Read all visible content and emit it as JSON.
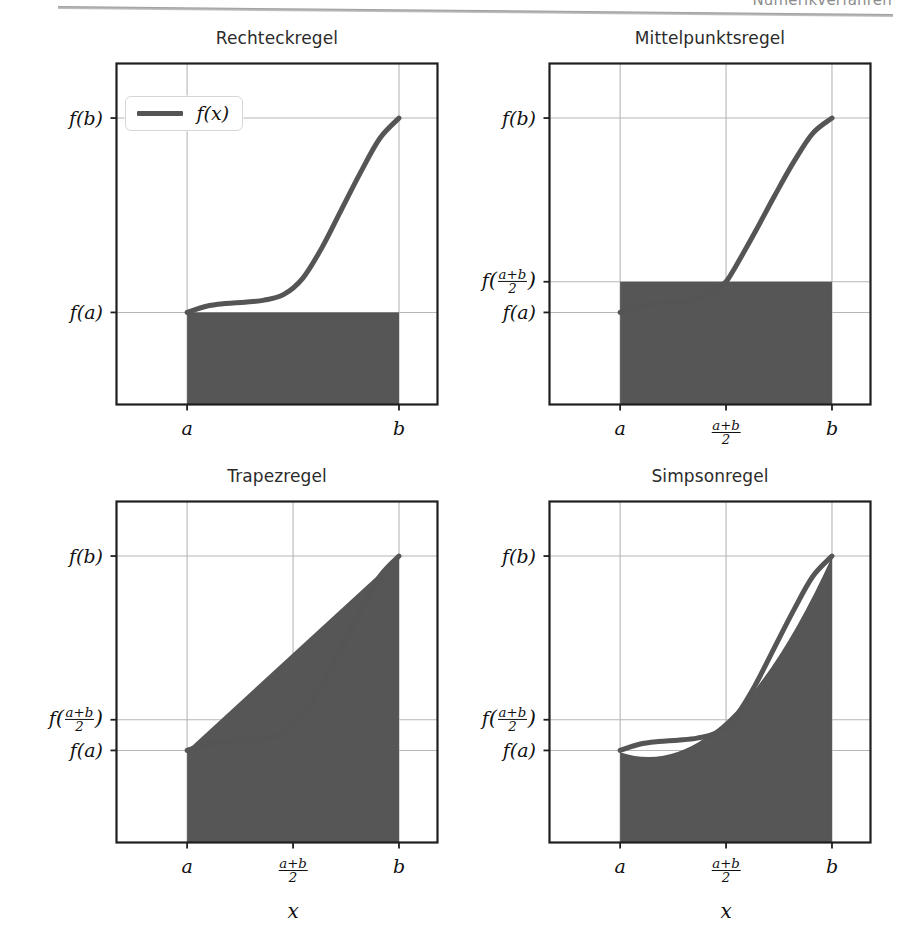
{
  "page": {
    "running_head": "Numerikverfahren",
    "bottom_caption": ""
  },
  "legend": {
    "entries": [
      {
        "label": "f(x)",
        "color": "#555555"
      }
    ]
  },
  "colors": {
    "curve": "#555555",
    "fill": "#565656",
    "grid": "#b6b6b6",
    "frame": "#1f1f1f",
    "title": "#2b2b2b"
  },
  "chart_data": [
    {
      "type": "area",
      "title": "Rechteckregel",
      "xlabel": "",
      "ylabel": "",
      "xlim": [
        0,
        1
      ],
      "ylim": [
        0,
        1
      ],
      "grid": true,
      "legend_position": "upper left",
      "xticks": [
        {
          "pos": 0.22,
          "label": "a"
        },
        {
          "pos": 0.88,
          "label": "b"
        }
      ],
      "yticks": [
        {
          "pos": 0.84,
          "label": "f(b)"
        },
        {
          "pos": 0.27,
          "label": "f(a)"
        }
      ],
      "series": [
        {
          "name": "f(x)",
          "x": [
            0.22,
            0.28,
            0.34,
            0.4,
            0.46,
            0.52,
            0.58,
            0.64,
            0.7,
            0.76,
            0.82,
            0.88
          ],
          "y": [
            0.27,
            0.288,
            0.296,
            0.3,
            0.306,
            0.322,
            0.37,
            0.46,
            0.57,
            0.68,
            0.78,
            0.84
          ]
        }
      ],
      "fill_region": {
        "name": "rectangle-left-endpoint",
        "shape": "rect",
        "x0": 0.22,
        "x1": 0.88,
        "y0": 0.0,
        "y1": 0.27
      }
    },
    {
      "type": "area",
      "title": "Mittelpunktsregel",
      "xlabel": "",
      "ylabel": "",
      "xlim": [
        0,
        1
      ],
      "ylim": [
        0,
        1
      ],
      "grid": true,
      "legend_position": "none",
      "xticks": [
        {
          "pos": 0.22,
          "label": "a"
        },
        {
          "pos": 0.55,
          "label": "(a+b)/2"
        },
        {
          "pos": 0.88,
          "label": "b"
        }
      ],
      "yticks": [
        {
          "pos": 0.84,
          "label": "f(b)"
        },
        {
          "pos": 0.36,
          "label": "f((a+b)/2)"
        },
        {
          "pos": 0.27,
          "label": "f(a)"
        }
      ],
      "series": [
        {
          "name": "f(x)",
          "x": [
            0.22,
            0.28,
            0.34,
            0.4,
            0.46,
            0.52,
            0.55,
            0.58,
            0.64,
            0.7,
            0.76,
            0.82,
            0.88
          ],
          "y": [
            0.27,
            0.288,
            0.296,
            0.3,
            0.31,
            0.34,
            0.36,
            0.405,
            0.505,
            0.61,
            0.71,
            0.795,
            0.84
          ]
        }
      ],
      "fill_region": {
        "name": "rectangle-midpoint",
        "shape": "rect",
        "x0": 0.22,
        "x1": 0.88,
        "y0": 0.0,
        "y1": 0.36
      }
    },
    {
      "type": "area",
      "title": "Trapezregel",
      "xlabel": "x",
      "ylabel": "",
      "xlim": [
        0,
        1
      ],
      "ylim": [
        0,
        1
      ],
      "grid": true,
      "legend_position": "none",
      "xticks": [
        {
          "pos": 0.22,
          "label": "a"
        },
        {
          "pos": 0.55,
          "label": "(a+b)/2"
        },
        {
          "pos": 0.88,
          "label": "b"
        }
      ],
      "yticks": [
        {
          "pos": 0.84,
          "label": "f(b)"
        },
        {
          "pos": 0.36,
          "label": "f((a+b)/2)"
        },
        {
          "pos": 0.27,
          "label": "f(a)"
        }
      ],
      "series": [
        {
          "name": "f(x)",
          "x": [
            0.22,
            0.28,
            0.34,
            0.4,
            0.46,
            0.52,
            0.58,
            0.64,
            0.7,
            0.76,
            0.82,
            0.88
          ],
          "y": [
            0.27,
            0.288,
            0.296,
            0.3,
            0.306,
            0.322,
            0.37,
            0.46,
            0.57,
            0.68,
            0.78,
            0.84
          ]
        }
      ],
      "fill_region": {
        "name": "trapezoid",
        "shape": "trapezoid",
        "x0": 0.22,
        "x1": 0.88,
        "y_at_x0": 0.27,
        "y_at_x1": 0.84,
        "base": 0.0
      }
    },
    {
      "type": "area",
      "title": "Simpsonregel",
      "xlabel": "x",
      "ylabel": "",
      "xlim": [
        0,
        1
      ],
      "ylim": [
        0,
        1
      ],
      "grid": true,
      "legend_position": "none",
      "xticks": [
        {
          "pos": 0.22,
          "label": "a"
        },
        {
          "pos": 0.55,
          "label": "(a+b)/2"
        },
        {
          "pos": 0.88,
          "label": "b"
        }
      ],
      "yticks": [
        {
          "pos": 0.84,
          "label": "f(b)"
        },
        {
          "pos": 0.36,
          "label": "f((a+b)/2)"
        },
        {
          "pos": 0.27,
          "label": "f(a)"
        }
      ],
      "series": [
        {
          "name": "f(x)",
          "x": [
            0.22,
            0.28,
            0.34,
            0.4,
            0.46,
            0.52,
            0.58,
            0.64,
            0.7,
            0.76,
            0.82,
            0.88
          ],
          "y": [
            0.27,
            0.288,
            0.296,
            0.3,
            0.306,
            0.322,
            0.37,
            0.46,
            0.57,
            0.68,
            0.78,
            0.84
          ]
        }
      ],
      "fill_region": {
        "name": "simpson-parabola",
        "shape": "parabola",
        "x0": 0.22,
        "xm": 0.55,
        "x1": 0.88,
        "y0": 0.265,
        "ym": 0.355,
        "y1": 0.838,
        "base": 0.0
      }
    }
  ]
}
